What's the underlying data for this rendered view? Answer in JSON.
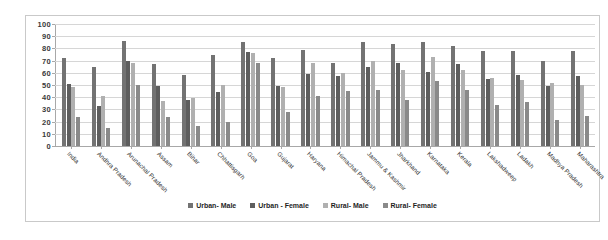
{
  "chart_data": {
    "type": "bar",
    "title": "",
    "xlabel": "",
    "ylabel": "",
    "ylim": [
      0,
      100
    ],
    "yticks": [
      0,
      10,
      20,
      30,
      40,
      50,
      60,
      70,
      80,
      90,
      100
    ],
    "grid": true,
    "legend_position": "bottom",
    "categories": [
      "India",
      "Andhra Pradesh",
      "Arunachal Pradesh",
      "Assam",
      "Bihar",
      "Chhattisgarh",
      "Goa",
      "Gujarat",
      "Haryana",
      "Himachal Pradesh",
      "Jammu & Kashmir",
      "Jharkhand",
      "Karnataka",
      "Kerala",
      "Lakshadweep",
      "Ladakh",
      "Madhya Pradesh",
      "Maharashtra"
    ],
    "series": [
      {
        "name": "Urban- Male",
        "color": "#737373",
        "values": [
          72,
          65,
          86,
          67,
          58,
          75,
          85,
          72,
          79,
          68,
          85,
          84,
          85,
          82,
          78,
          78,
          70,
          78
        ]
      },
      {
        "name": "Urban - Female",
        "color": "#5e5e5e",
        "values": [
          51,
          33,
          70,
          49,
          38,
          44,
          77,
          49,
          59,
          57,
          65,
          68,
          61,
          67,
          55,
          58,
          49,
          57
        ]
      },
      {
        "name": "Rural- Male",
        "color": "#b0b0b0",
        "values": [
          48,
          41,
          68,
          37,
          39,
          50,
          76,
          48,
          68,
          60,
          70,
          62,
          73,
          62,
          56,
          54,
          52,
          50
        ]
      },
      {
        "name": "Rural- Female",
        "color": "#8a8a8a",
        "values": [
          24,
          15,
          50,
          24,
          16,
          20,
          68,
          28,
          41,
          45,
          46,
          38,
          53,
          46,
          34,
          36,
          21,
          25
        ]
      }
    ]
  },
  "legend": {
    "items": [
      {
        "label": "Urban- Male"
      },
      {
        "label": "Urban - Female"
      },
      {
        "label": "Rural- Male"
      },
      {
        "label": "Rural- Female"
      }
    ]
  },
  "colors": {
    "series_1": "#737373",
    "series_2": "#5e5e5e",
    "series_3": "#b0b0b0",
    "series_4": "#8a8a8a",
    "gridline": "#d6d6d6",
    "axis": "#a8a8a8",
    "border": "#c9c9c9"
  }
}
